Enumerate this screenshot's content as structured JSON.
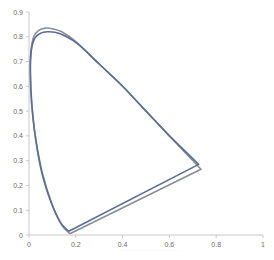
{
  "chart_data": {
    "type": "line",
    "title": "",
    "xlabel": "",
    "ylabel": "",
    "xlim": [
      0,
      1
    ],
    "ylim": [
      0,
      0.9
    ],
    "x_ticks": [
      "0",
      "0.2",
      "0.4",
      "0.6",
      "0.8",
      "1"
    ],
    "y_ticks": [
      "0",
      "0.1",
      "0.2",
      "0.3",
      "0.4",
      "0.5",
      "0.6",
      "0.7",
      "0.8",
      "0.9"
    ],
    "grid": false,
    "legend": null,
    "series": [
      {
        "name": "gamut-outer",
        "color": "#8a8d94",
        "x": [
          0.175,
          0.14,
          0.1,
          0.06,
          0.03,
          0.012,
          0.005,
          0.008,
          0.02,
          0.04,
          0.07,
          0.1,
          0.14,
          0.2,
          0.3,
          0.4,
          0.5,
          0.6,
          0.735,
          0.175
        ],
        "y": [
          0.005,
          0.04,
          0.12,
          0.24,
          0.38,
          0.52,
          0.65,
          0.74,
          0.8,
          0.825,
          0.835,
          0.832,
          0.82,
          0.78,
          0.69,
          0.6,
          0.5,
          0.4,
          0.265,
          0.005
        ]
      },
      {
        "name": "gamut-inner",
        "color": "#5a6e96",
        "x": [
          0.17,
          0.135,
          0.095,
          0.055,
          0.028,
          0.012,
          0.006,
          0.01,
          0.025,
          0.05,
          0.08,
          0.11,
          0.15,
          0.21,
          0.3,
          0.4,
          0.5,
          0.6,
          0.725,
          0.17
        ],
        "y": [
          0.015,
          0.05,
          0.13,
          0.25,
          0.39,
          0.53,
          0.66,
          0.745,
          0.795,
          0.815,
          0.82,
          0.818,
          0.805,
          0.77,
          0.69,
          0.6,
          0.5,
          0.4,
          0.285,
          0.015
        ]
      }
    ]
  },
  "caption": "· · · · · · · · · · · · · · · ·"
}
